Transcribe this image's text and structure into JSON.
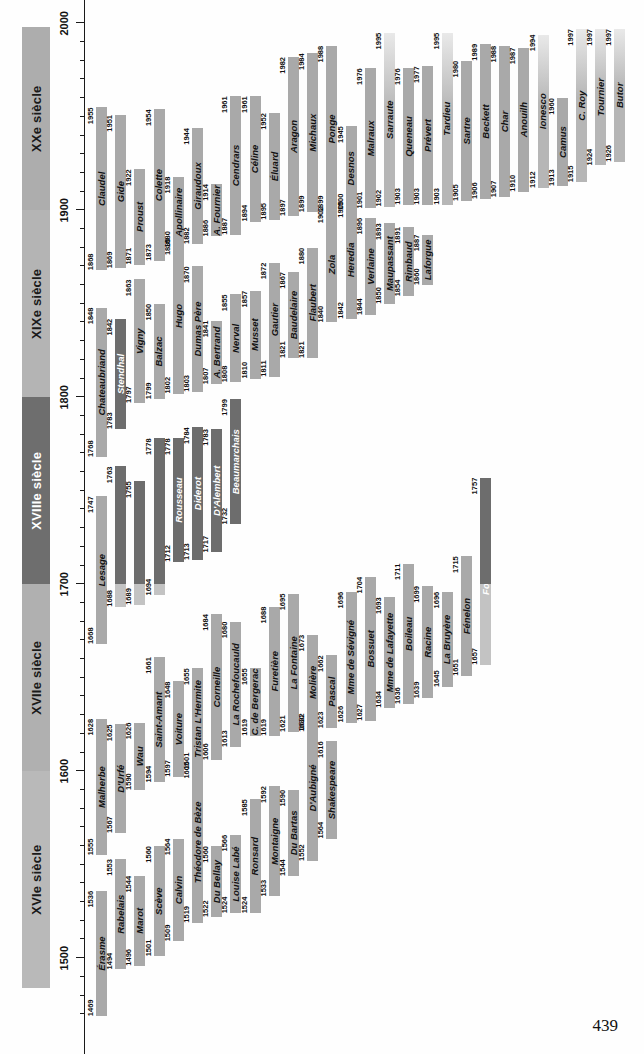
{
  "figure": {
    "page_number": "439",
    "axis": {
      "min_year": 1468,
      "max_year": 2005,
      "major_ticks": [
        1500,
        1600,
        1700,
        1800,
        1900,
        2000
      ],
      "major_tick_labels": [
        "1500",
        "1600",
        "1700",
        "1800",
        "1900",
        "2000"
      ],
      "minor_tick_step": 10,
      "orientation": "vertical-rotated"
    },
    "centuries": [
      {
        "label": "XVIe siècle",
        "start": 1484,
        "end": 1600,
        "tone": "c-16"
      },
      {
        "label": "XVIIe siècle",
        "start": 1600,
        "end": 1700,
        "tone": "c-17"
      },
      {
        "label": "XVIIIe siècle",
        "start": 1700,
        "end": 1800,
        "tone": "c-18"
      },
      {
        "label": "XIXe siècle",
        "start": 1800,
        "end": 1900,
        "tone": "c-19"
      },
      {
        "label": "XXe siècle",
        "start": 1900,
        "end": 1998,
        "tone": "c-20"
      }
    ]
  },
  "chart_data": {
    "type": "bar",
    "xlabel": "",
    "ylabel": "",
    "xlim": [
      1468,
      2005
    ],
    "grid": false,
    "legend": "none",
    "note": "Horizontal lifespan bars (birth year to death year) per author, arranged in rows.",
    "authors": [
      {
        "name": "Érasme",
        "start": 1469,
        "end": 1536,
        "row": 0,
        "tone": "tone-mid"
      },
      {
        "name": "Rabelais",
        "start": 1494,
        "end": 1553,
        "row": 1,
        "tone": "tone-mid"
      },
      {
        "name": "Marot",
        "start": 1496,
        "end": 1544,
        "row": 2,
        "tone": "tone-mid"
      },
      {
        "name": "Scève",
        "start": 1501,
        "end": 1560,
        "row": 3,
        "tone": "tone-mid"
      },
      {
        "name": "Calvin",
        "start": 1509,
        "end": 1564,
        "row": 4,
        "tone": "tone-mid"
      },
      {
        "name": "Théodore de Bèze",
        "start": 1519,
        "end": 1605,
        "row": 5,
        "tone": "tone-mid"
      },
      {
        "name": "Du Bellay",
        "start": 1522,
        "end": 1560,
        "row": 6,
        "tone": "tone-mid"
      },
      {
        "name": "Louise Labé",
        "start": 1524,
        "end": 1566,
        "row": 7,
        "tone": "tone-mid"
      },
      {
        "name": "Ronsard",
        "start": 1524,
        "end": 1585,
        "row": 8,
        "tone": "tone-mid"
      },
      {
        "name": "Montaigne",
        "start": 1533,
        "end": 1592,
        "row": 9,
        "tone": "tone-mid"
      },
      {
        "name": "Du Bartas",
        "start": 1544,
        "end": 1590,
        "row": 10,
        "tone": "tone-mid"
      },
      {
        "name": "D'Aubigné",
        "start": 1552,
        "end": 1630,
        "row": 11,
        "tone": "tone-mid"
      },
      {
        "name": "Shakespeare",
        "start": 1564,
        "end": 1616,
        "row": 12,
        "tone": "tone-mid"
      },
      {
        "name": "Malherbe",
        "start": 1555,
        "end": 1628,
        "row": 0,
        "tone": "tone-mid"
      },
      {
        "name": "D'Urfé",
        "start": 1567,
        "end": 1625,
        "row": 1,
        "tone": "tone-mid"
      },
      {
        "name": "Wau",
        "start": 1590,
        "end": 1626,
        "row": 2,
        "tone": "tone-mid"
      },
      {
        "name": "Saint-Amant",
        "start": 1594,
        "end": 1661,
        "row": 3,
        "tone": "tone-mid"
      },
      {
        "name": "Voiture",
        "start": 1597,
        "end": 1648,
        "row": 4,
        "tone": "tone-mid"
      },
      {
        "name": "Tristan L'Hermite",
        "start": 1601,
        "end": 1655,
        "row": 5,
        "tone": "tone-mid"
      },
      {
        "name": "Corneille",
        "start": 1606,
        "end": 1684,
        "row": 6,
        "tone": "tone-mid"
      },
      {
        "name": "La Rochefoucauld",
        "start": 1613,
        "end": 1680,
        "row": 7,
        "tone": "tone-mid"
      },
      {
        "name": "C. de Bergerac",
        "start": 1619,
        "end": 1655,
        "row": 8,
        "tone": "tone-mid"
      },
      {
        "name": "Furetière",
        "start": 1619,
        "end": 1688,
        "row": 9,
        "tone": "tone-mid"
      },
      {
        "name": "La Fontaine",
        "start": 1621,
        "end": 1695,
        "row": 10,
        "tone": "tone-mid"
      },
      {
        "name": "Molière",
        "start": 1622,
        "end": 1673,
        "row": 11,
        "tone": "tone-mid"
      },
      {
        "name": "Pascal",
        "start": 1623,
        "end": 1662,
        "row": 12,
        "tone": "tone-mid"
      },
      {
        "name": "Mme de Sévigné",
        "start": 1626,
        "end": 1696,
        "row": 13,
        "tone": "tone-mid"
      },
      {
        "name": "Bossuet",
        "start": 1627,
        "end": 1704,
        "row": 14,
        "tone": "tone-mid"
      },
      {
        "name": "Mme de Lafayette",
        "start": 1634,
        "end": 1693,
        "row": 15,
        "tone": "tone-mid"
      },
      {
        "name": "Boileau",
        "start": 1636,
        "end": 1711,
        "row": 16,
        "tone": "tone-mid"
      },
      {
        "name": "Racine",
        "start": 1639,
        "end": 1699,
        "row": 17,
        "tone": "tone-mid"
      },
      {
        "name": "La Bruyère",
        "start": 1645,
        "end": 1696,
        "row": 18,
        "tone": "tone-mid"
      },
      {
        "name": "Fénelon",
        "start": 1651,
        "end": 1715,
        "row": 19,
        "tone": "tone-mid"
      },
      {
        "name": "Fontenelle",
        "start": 1657,
        "end": 1757,
        "row": 20,
        "tone": "tone-dark"
      },
      {
        "name": "Lesage",
        "start": 1668,
        "end": 1747,
        "row": 0,
        "tone": "tone-mid"
      },
      {
        "name": "Marivaux",
        "start": 1688,
        "end": 1763,
        "row": 1,
        "tone": "tone-dark"
      },
      {
        "name": "Montesquieu",
        "start": 1689,
        "end": 1755,
        "row": 2,
        "tone": "tone-dark"
      },
      {
        "name": "Voltaire",
        "start": 1694,
        "end": 1778,
        "row": 3,
        "tone": "tone-dark"
      },
      {
        "name": "Rousseau",
        "start": 1712,
        "end": 1778,
        "row": 4,
        "tone": "tone-dark"
      },
      {
        "name": "Diderot",
        "start": 1713,
        "end": 1784,
        "row": 5,
        "tone": "tone-dark"
      },
      {
        "name": "D'Alembert",
        "start": 1717,
        "end": 1783,
        "row": 6,
        "tone": "tone-dark"
      },
      {
        "name": "Beaumarchais",
        "start": 1732,
        "end": 1799,
        "row": 7,
        "tone": "tone-dark"
      },
      {
        "name": "Chateaubriand",
        "start": 1768,
        "end": 1848,
        "row": 0,
        "tone": "tone-mid"
      },
      {
        "name": "Stendhal",
        "start": 1783,
        "end": 1842,
        "row": 1,
        "tone": "tone-dark"
      },
      {
        "name": "Vigny",
        "start": 1797,
        "end": 1863,
        "row": 2,
        "tone": "tone-mid"
      },
      {
        "name": "Balzac",
        "start": 1799,
        "end": 1850,
        "row": 3,
        "tone": "tone-mid"
      },
      {
        "name": "Hugo",
        "start": 1802,
        "end": 1885,
        "row": 4,
        "tone": "tone-mid"
      },
      {
        "name": "Dumas Père",
        "start": 1803,
        "end": 1870,
        "row": 5,
        "tone": "tone-mid"
      },
      {
        "name": "A. Bertrand",
        "start": 1807,
        "end": 1841,
        "row": 6,
        "tone": "tone-mid"
      },
      {
        "name": "Nerval",
        "start": 1808,
        "end": 1855,
        "row": 7,
        "tone": "tone-mid"
      },
      {
        "name": "Musset",
        "start": 1810,
        "end": 1857,
        "row": 8,
        "tone": "tone-mid"
      },
      {
        "name": "Gautier",
        "start": 1811,
        "end": 1872,
        "row": 9,
        "tone": "tone-mid"
      },
      {
        "name": "Baudelaire",
        "start": 1821,
        "end": 1867,
        "row": 10,
        "tone": "tone-mid"
      },
      {
        "name": "Flaubert",
        "start": 1821,
        "end": 1880,
        "row": 11,
        "tone": "tone-mid"
      },
      {
        "name": "Zola",
        "start": 1840,
        "end": 1902,
        "row": 12,
        "tone": "tone-mid"
      },
      {
        "name": "Heredia",
        "start": 1842,
        "end": 1905,
        "row": 13,
        "tone": "tone-mid"
      },
      {
        "name": "Verlaine",
        "start": 1844,
        "end": 1896,
        "row": 14,
        "tone": "tone-mid"
      },
      {
        "name": "Maupassant",
        "start": 1850,
        "end": 1893,
        "row": 15,
        "tone": "tone-mid"
      },
      {
        "name": "Rimbaud",
        "start": 1854,
        "end": 1891,
        "row": 16,
        "tone": "tone-mid"
      },
      {
        "name": "Laforgue",
        "start": 1860,
        "end": 1887,
        "row": 17,
        "tone": "tone-mid"
      },
      {
        "name": "Claudel",
        "start": 1868,
        "end": 1955,
        "row": 0,
        "tone": "tone-mid"
      },
      {
        "name": "Gide",
        "start": 1869,
        "end": 1951,
        "row": 1,
        "tone": "tone-mid"
      },
      {
        "name": "Proust",
        "start": 1871,
        "end": 1922,
        "row": 2,
        "tone": "tone-mid"
      },
      {
        "name": "Colette",
        "start": 1873,
        "end": 1954,
        "row": 3,
        "tone": "tone-mid"
      },
      {
        "name": "Apollinaire",
        "start": 1880,
        "end": 1918,
        "row": 4,
        "tone": "tone-mid"
      },
      {
        "name": "Giraudoux",
        "start": 1882,
        "end": 1944,
        "row": 5,
        "tone": "tone-mid"
      },
      {
        "name": "A. Fournier",
        "start": 1886,
        "end": 1914,
        "row": 6,
        "tone": "tone-mid"
      },
      {
        "name": "Cendrars",
        "start": 1887,
        "end": 1961,
        "row": 7,
        "tone": "tone-mid"
      },
      {
        "name": "Céline",
        "start": 1894,
        "end": 1961,
        "row": 8,
        "tone": "tone-mid"
      },
      {
        "name": "Éluard",
        "start": 1895,
        "end": 1952,
        "row": 9,
        "tone": "tone-mid"
      },
      {
        "name": "Aragon",
        "start": 1897,
        "end": 1982,
        "row": 10,
        "tone": "tone-mid"
      },
      {
        "name": "Michaux",
        "start": 1899,
        "end": 1984,
        "row": 11,
        "tone": "tone-mid"
      },
      {
        "name": "Ponge",
        "start": 1899,
        "end": 1988,
        "row": 12,
        "tone": "tone-mid"
      },
      {
        "name": "Desnos",
        "start": 1900,
        "end": 1945,
        "row": 13,
        "tone": "tone-mid"
      },
      {
        "name": "Malraux",
        "start": 1901,
        "end": 1976,
        "row": 14,
        "tone": "tone-mid"
      },
      {
        "name": "Sarraute",
        "start": 1902,
        "end": 1995,
        "row": 15,
        "tone": "tone-fade"
      },
      {
        "name": "Queneau",
        "start": 1903,
        "end": 1976,
        "row": 16,
        "tone": "tone-mid"
      },
      {
        "name": "Prévert",
        "start": 1903,
        "end": 1977,
        "row": 17,
        "tone": "tone-mid"
      },
      {
        "name": "Tardieu",
        "start": 1903,
        "end": 1995,
        "row": 18,
        "tone": "tone-fade"
      },
      {
        "name": "Sartre",
        "start": 1905,
        "end": 1980,
        "row": 19,
        "tone": "tone-mid"
      },
      {
        "name": "Beckett",
        "start": 1906,
        "end": 1989,
        "row": 20,
        "tone": "tone-mid"
      },
      {
        "name": "Char",
        "start": 1907,
        "end": 1988,
        "row": 21,
        "tone": "tone-mid"
      },
      {
        "name": "Anouilh",
        "start": 1910,
        "end": 1987,
        "row": 22,
        "tone": "tone-mid"
      },
      {
        "name": "Ionesco",
        "start": 1912,
        "end": 1994,
        "row": 23,
        "tone": "tone-fade"
      },
      {
        "name": "Camus",
        "start": 1913,
        "end": 1960,
        "row": 24,
        "tone": "tone-mid"
      },
      {
        "name": "C. Roy",
        "start": 1915,
        "end": 1997,
        "row": 25,
        "tone": "tone-fade"
      },
      {
        "name": "Tournier",
        "start": 1924,
        "end": 1997,
        "row": 26,
        "tone": "tone-fade"
      },
      {
        "name": "Butor",
        "start": 1926,
        "end": 1997,
        "row": 27,
        "tone": "tone-fade"
      }
    ]
  }
}
